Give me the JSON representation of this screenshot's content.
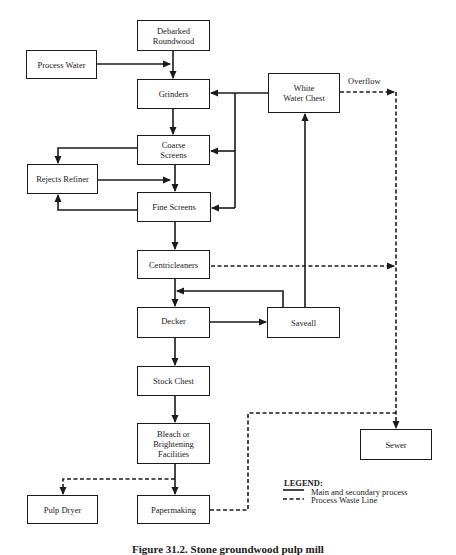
{
  "diagram": {
    "boxes": {
      "debarked": "Debarked\nRoundwood",
      "process_water": "Process Water",
      "grinders": "Grinders",
      "white_water_chest": "White\nWater Chest",
      "coarse_screens": "Coarse\nScreens",
      "rejects_refiner": "Rejects Refiner",
      "fine_screens": "Fine Screens",
      "centricleaners": "Centricleaners",
      "decker": "Decker",
      "saveall": "Saveall",
      "stock_chest": "Stock Chest",
      "bleach": "Bleach or\nBrightening\nFacilities",
      "sewer": "Sewer",
      "pulp_dryer": "Pulp Dryer",
      "papermaking": "Papermaking"
    },
    "labels": {
      "overflow": "Overflow"
    },
    "legend": {
      "title": "LEGEND:",
      "solid": "Main and secondary process",
      "dashed": "Process Waste Line"
    },
    "caption": "Figure 31.2. Stone groundwood pulp mill",
    "colors": {
      "line": "#1a1a1a",
      "background": "#ffffff"
    }
  }
}
